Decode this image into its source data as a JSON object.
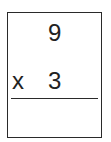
{
  "problem": {
    "multiplicand": "9",
    "operator": "x",
    "multiplier": "3",
    "answer": ""
  }
}
